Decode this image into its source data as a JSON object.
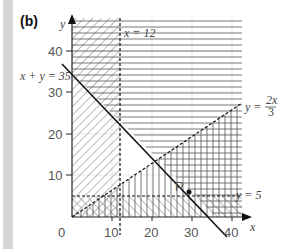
{
  "panel_label": "(b)",
  "axes": {
    "x_label": "x",
    "y_label": "y",
    "origin_label": "0",
    "x_ticks": [
      "10",
      "20",
      "30",
      "40"
    ],
    "y_ticks": [
      "10",
      "20",
      "30",
      "40"
    ]
  },
  "lines": {
    "x12": {
      "label": "x = 12",
      "style": "dashed"
    },
    "sum35": {
      "label": "x + y = 35",
      "style": "solid"
    },
    "y2x3": {
      "label_prefix": "y = ",
      "frac_num": "2x",
      "frac_den": "3",
      "style": "dashed"
    },
    "y5": {
      "label": "y = 5",
      "style": "dashed"
    }
  },
  "point": {
    "label": "P",
    "x": 30,
    "y": 5
  },
  "colors": {
    "line": "#222222",
    "hatch": "#555555",
    "grid": "#e6e6e6",
    "bar": "#d6d6d6"
  }
}
